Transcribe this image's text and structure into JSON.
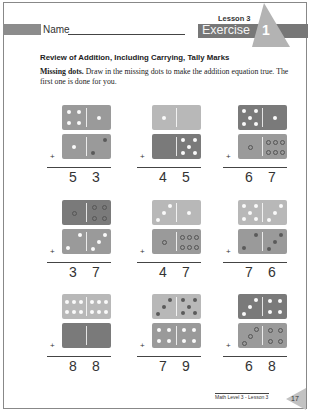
{
  "header": {
    "name_label": "Name",
    "lesson": "Lesson 3",
    "exercise_word": "Exercise",
    "exercise_number": "1"
  },
  "section_title": "Review of Addition, Including Carrying, Tally Marks",
  "instructions": {
    "lead": "Missing dots.",
    "text": " Draw in the missing dots to make the addition equation true. The first one is done for you."
  },
  "colors": {
    "domino_dark": "#7a7a7a",
    "domino_mid": "#9a9a9a",
    "domino_light": "#b8b8b8",
    "badge_bar": "#777777",
    "badge_triangle": "#b3b3b3"
  },
  "problems": [
    {
      "top": {
        "left": 4,
        "right": 1,
        "shade": "mid"
      },
      "bottom": {
        "left": 1,
        "right": "2 (drawn)",
        "shade": "mid"
      },
      "sum_tens": "5",
      "sum_ones": "3"
    },
    {
      "top": {
        "left": 1,
        "right": 0,
        "shade": "light"
      },
      "bottom": {
        "left": 0,
        "right": 5,
        "shade": "dark"
      },
      "sum_tens": "4",
      "sum_ones": "5"
    },
    {
      "top": {
        "left": 5,
        "right": 1,
        "shade": "dark"
      },
      "bottom": {
        "left": "1 (outline)",
        "right": "6 (outline)",
        "shade": "mid"
      },
      "sum_tens": "6",
      "sum_ones": "7"
    },
    {
      "top": {
        "left": "1 (outline)",
        "right": "4 (outline)",
        "shade": "dark"
      },
      "bottom": {
        "left": 2,
        "right": 3,
        "shade": "mid"
      },
      "sum_tens": "3",
      "sum_ones": "7"
    },
    {
      "top": {
        "left": 3,
        "right": 1,
        "shade": "light"
      },
      "bottom": {
        "left": "1 (outline)",
        "right": "6 (outline)",
        "shade": "mid"
      },
      "sum_tens": "4",
      "sum_ones": "7"
    },
    {
      "top": {
        "left": 5,
        "right": 3,
        "shade": "light"
      },
      "bottom": {
        "left": "2 (drawn)",
        "right": "3 (drawn)",
        "shade": "mid"
      },
      "sum_tens": "7",
      "sum_ones": "6"
    },
    {
      "top": {
        "left": 6,
        "right": 6,
        "shade": "light"
      },
      "bottom": {
        "left": 0,
        "right": 0,
        "shade": "dark"
      },
      "sum_tens": "8",
      "sum_ones": "8"
    },
    {
      "top": {
        "left": "3 (drawn)",
        "right": "5 (drawn)",
        "shade": "light"
      },
      "bottom": {
        "left": 4,
        "right": 4,
        "shade": "mid"
      },
      "sum_tens": "7",
      "sum_ones": "9"
    },
    {
      "top": {
        "left": 3,
        "right": 4,
        "shade": "dark"
      },
      "bottom": {
        "left": "3 (outline)",
        "right": "4 (outline)",
        "shade": "mid"
      },
      "sum_tens": "6",
      "sum_ones": "8"
    }
  ],
  "footer": {
    "text": "Math Level 3 - Lesson 3",
    "page_number": "17"
  }
}
